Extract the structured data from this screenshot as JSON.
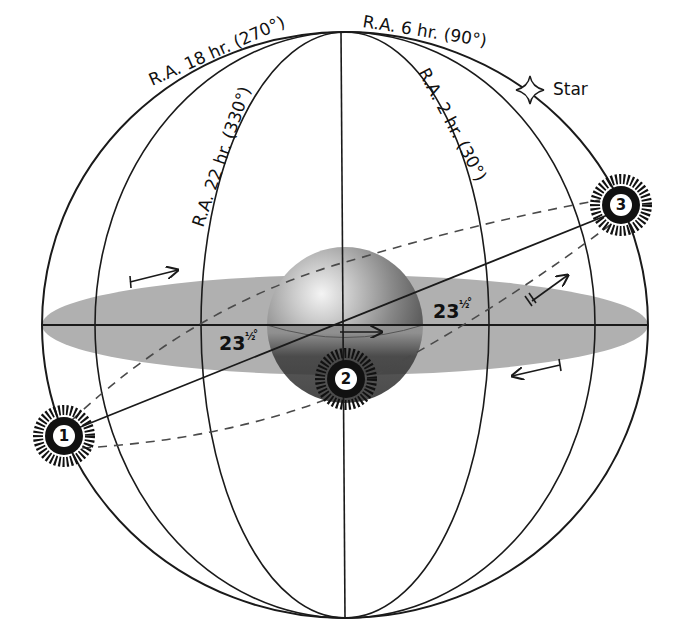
{
  "figure": {
    "colors": {
      "background": "#ffffff",
      "line": "#1a1a1a",
      "equator_plane": "#aeaeae",
      "earth_light": "#e8e8e8",
      "earth_dark": "#3a3a3a",
      "sun": "#111111"
    }
  },
  "meridian_labels": {
    "ra_18": "R.A.  18 hr.  (270°)",
    "ra_6": "R.A.  6 hr.  (90°)",
    "ra_22": "R.A.  22 hr.  (330°)",
    "ra_2": "R.A.  2 hr.  (30°)"
  },
  "star": {
    "label": "Star",
    "icon": "four-point-star-icon"
  },
  "angles": {
    "left": {
      "whole": "23",
      "fraction": "½",
      "unit": "°"
    },
    "right": {
      "whole": "23",
      "fraction": "½",
      "unit": "°"
    }
  },
  "sun_positions": [
    {
      "id": "1",
      "label": "1"
    },
    {
      "id": "2",
      "label": "2"
    },
    {
      "id": "3",
      "label": "3"
    }
  ],
  "arrows": [
    {
      "name": "upper-left-motion-arrow",
      "direction": "right"
    },
    {
      "name": "earth-rotation-arrow",
      "direction": "right"
    },
    {
      "name": "upper-right-motion-arrow",
      "direction": "up-right"
    },
    {
      "name": "lower-right-motion-arrow",
      "direction": "left"
    }
  ]
}
